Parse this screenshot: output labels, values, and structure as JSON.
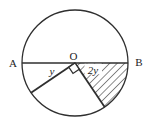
{
  "figure": {
    "labels": {
      "center": "O",
      "diameter_left": "A",
      "diameter_right": "B",
      "angle_left": "y",
      "angle_right": "2y"
    },
    "marks": {
      "right_angle": "small square at O between the two radii",
      "shading": "diagonal hatching in sector near B"
    },
    "colors": {
      "stroke": "#2f2f2f",
      "background": "#ffffff"
    }
  }
}
